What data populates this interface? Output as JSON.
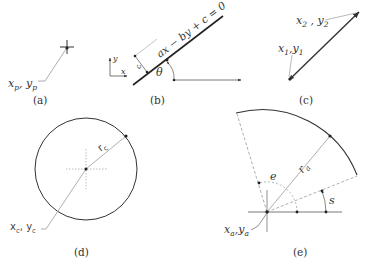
{
  "figure": {
    "panels": [
      {
        "id": "a",
        "caption": "(a)",
        "title": "Point",
        "labels": {
          "point_x": "x",
          "point_x_sub": "p",
          "sep": ", ",
          "point_y": "y",
          "point_y_sub": "p"
        }
      },
      {
        "id": "b",
        "caption": "(b)",
        "title": "Line",
        "labels": {
          "equation": "ax − by + c = 0",
          "angle": "θ",
          "axis_x": "x",
          "axis_y": "y",
          "offset": "c"
        }
      },
      {
        "id": "c",
        "caption": "(c)",
        "title": "Line segment",
        "labels": {
          "start_x": "x",
          "start_x_sub": "1",
          "start_sep": ",",
          "start_y": "y",
          "start_y_sub": "1",
          "end_x": "x",
          "end_x_sub": "2",
          "end_sep": " , ",
          "end_y": "y",
          "end_y_sub": "2"
        }
      },
      {
        "id": "d",
        "caption": "(d)",
        "title": "Circle",
        "labels": {
          "radius": "r",
          "radius_sub": "c",
          "center_x": "x",
          "center_x_sub": "c",
          "sep": ", ",
          "center_y": "y",
          "center_y_sub": "c"
        }
      },
      {
        "id": "e",
        "caption": "(e)",
        "title": "Arc",
        "labels": {
          "radius": "r",
          "radius_sub": "a",
          "start_angle": "s",
          "end_angle": "e",
          "center_x": "x",
          "center_x_sub": "a",
          "sep": ",",
          "center_y": "y",
          "center_y_sub": "a"
        }
      }
    ],
    "colors": {
      "stroke": "#333333",
      "light_stroke": "#888888",
      "dashed": "#999999"
    }
  }
}
